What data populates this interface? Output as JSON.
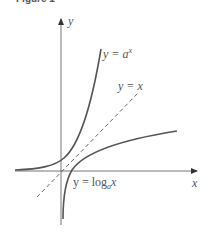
{
  "figure": {
    "title": "Figure 1",
    "axes": {
      "x_label": "x",
      "y_label": "y"
    },
    "curves": [
      {
        "id": "exponential",
        "label_lhs": "y = ",
        "label_base": "a",
        "label_sup": "x"
      },
      {
        "id": "identity",
        "label": "y = x",
        "style": "dashed"
      },
      {
        "id": "logarithm",
        "label_lhs": "y = log",
        "label_sub": "a",
        "label_arg": "x"
      }
    ],
    "colors": {
      "curve": "#555555",
      "axis": "#777777",
      "dashed": "#666666"
    }
  }
}
